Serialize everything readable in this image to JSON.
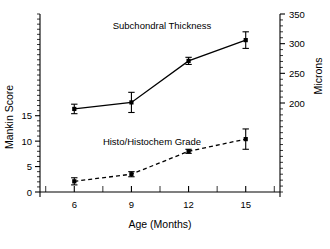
{
  "chart_data": {
    "type": "line",
    "title": "",
    "xlabel": "Age (Months)",
    "x": [
      6,
      9,
      12,
      15
    ],
    "xtick_labels": [
      "6",
      "9",
      "12",
      "15"
    ],
    "xlim": [
      4.2,
      16.8
    ],
    "grid": false,
    "legend_position": "inline-annotation",
    "axes": [
      {
        "id": "left",
        "ylabel": "Mankin Score",
        "ytick_labels": [
          "0",
          "5",
          "10",
          "15"
        ],
        "ytick_values": [
          0,
          5,
          10,
          15
        ],
        "ylim": [
          0,
          35
        ],
        "minor_ticks_per_interval": 4
      },
      {
        "id": "right",
        "ylabel": "Microns",
        "ytick_labels": [
          "200",
          "250",
          "300",
          "350"
        ],
        "ytick_values": [
          200,
          250,
          300,
          350
        ],
        "ylim": [
          50,
          350
        ],
        "minor_ticks_per_interval": 4
      }
    ],
    "series": [
      {
        "name": "Subchondral Thickness",
        "axis": "right",
        "units": "Microns",
        "linestyle": "solid",
        "marker": "square",
        "color": "#000000",
        "values": [
          190,
          201,
          271,
          306
        ],
        "err_low": [
          8,
          17,
          6,
          14
        ],
        "err_high": [
          8,
          17,
          6,
          14
        ],
        "annotation": "Subchondral Thickness"
      },
      {
        "name": "Histo/Histochem Grade",
        "axis": "left",
        "units": "Mankin Score",
        "linestyle": "dashed",
        "marker": "square",
        "color": "#000000",
        "values": [
          2.1,
          3.5,
          8.0,
          10.4
        ],
        "err_low": [
          0.7,
          0.5,
          0.4,
          2.0
        ],
        "err_high": [
          0.7,
          0.5,
          0.4,
          2.0
        ],
        "annotation": "Histo/Histochem Grade"
      }
    ]
  },
  "layout": {
    "plot_left": 40,
    "plot_right": 280,
    "plot_top": 14,
    "plot_bottom": 192
  }
}
